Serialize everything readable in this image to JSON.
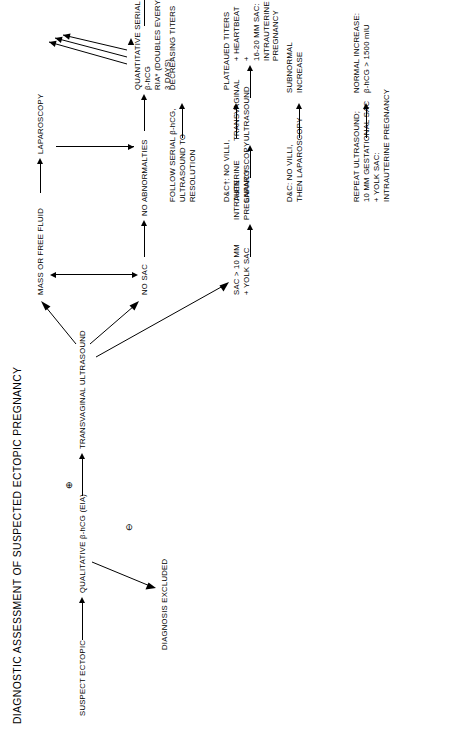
{
  "title": "DIAGNOSTIC ASSESSMENT OF SUSPECTED ECTOPIC PREGNANCY",
  "symbols": {
    "positive": "⊕",
    "negative": "⊖"
  },
  "nodes": {
    "suspect_ectopic": "SUSPECT ECTOPIC",
    "qualitative": "QUALITATIVE β-hCG (EIA)",
    "diagnosis_excluded": "DIAGNOSIS EXCLUDED",
    "transvaginal_ultrasound": "TRANSVAGINAL ULTRASOUND",
    "mass_or_free_fluid": "MASS OR FREE FLUID",
    "laparoscopy": "LAPAROSCOPY",
    "no_sac": "NO SAC",
    "no_abnormalities": "NO ABNORMALTIES",
    "quantitative_serial": "QUANTITATIVE SERIAL β-hCG\nRIA* (DOUBLES EVERY 3 DAYS)",
    "decreasing_titers": "DECREASING TITERS",
    "plateaued_titers": "PLATEAUED TITERS",
    "subnormal_increase": "SUBNORMAL\nINCREASE",
    "normal_increase": "NORMAL INCREASE:\nβ-hCG > 1500 mIU",
    "follow_serial": "FOLLOW SERIAL β-hCG,\nULTRASOUND TO\nRESOLUTION",
    "dc_plateaued": "D&C†: NO VILLI,\nTHEN\nLAPAROSCOPY",
    "dc_subnormal": "D&C: NO VILLI,\nTHEN LAPAROSCOPY",
    "repeat_ultrasound": "REPEAT ULTRASOUND;\n10 MM GESTATIONAL SAC\n+ YOLK SAC:\nINTRAUTERINE PREGNANCY",
    "sac_10mm": "SAC > 10 MM\n+ YOLK SAC",
    "intrauterine_pregnancy": "INTRAUTERINE\nPREGNANCY",
    "transvaginal_ultrasound_2": "TRANSVAGINAL\nULTRASOUND",
    "heartbeat": "+ HEARTBEAT +\n16-20 MM SAC:\nINTRAUTERINE\nPREGNANCY"
  }
}
